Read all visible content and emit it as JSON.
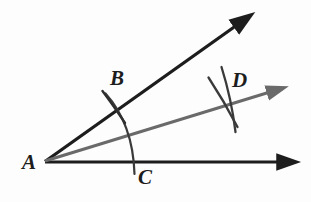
{
  "figure": {
    "background_color": "#fdfdfd",
    "ray_color": "#1d1d1d",
    "bisector_color": "#6a6a6a",
    "arc_color": "#3a3a3a",
    "labels": {
      "vertex": "A",
      "upper_arc_point": "B",
      "lower_arc_point": "C",
      "bisector_arc_point": "D"
    },
    "points": {
      "A": {
        "x": 44,
        "y": 162
      },
      "B": {
        "x": 113,
        "y": 103
      },
      "C": {
        "x": 134,
        "y": 162
      },
      "D": {
        "x": 228,
        "y": 100
      }
    },
    "rays": [
      {
        "name": "upper-ray",
        "from": "A",
        "to_x": 245,
        "to_y": 17,
        "color": "#1d1d1d",
        "arrowhead": true
      },
      {
        "name": "bisector-ray",
        "from": "A",
        "to_x": 278,
        "to_y": 87,
        "color": "#6a6a6a",
        "arrowhead": true
      },
      {
        "name": "horizontal-ray",
        "from": "A",
        "to_x": 289,
        "to_y": 162,
        "color": "#1d1d1d",
        "arrowhead": true
      }
    ],
    "arcs": [
      {
        "name": "arc-BC",
        "description": "arc centered at A through B and C"
      },
      {
        "name": "arc-from-B",
        "description": "arc centered at B crossing near D"
      },
      {
        "name": "arc-from-C",
        "description": "arc centered at C crossing near D"
      },
      {
        "name": "tick-at-B",
        "description": "short tick mark crossing the upper ray at B"
      }
    ]
  }
}
